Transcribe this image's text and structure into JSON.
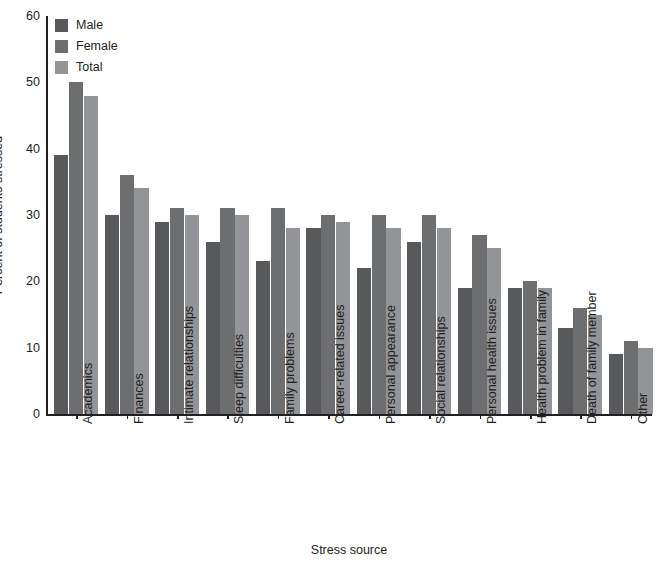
{
  "chart_data": {
    "type": "bar",
    "title": "",
    "xlabel": "Stress source",
    "ylabel": "Percent of students stressed",
    "ylim": [
      0,
      60
    ],
    "yticks": [
      0,
      10,
      20,
      30,
      40,
      50,
      60
    ],
    "grid": false,
    "legend_position": "top-left",
    "categories": [
      "Academics",
      "Finances",
      "Intimate relationships",
      "Sleep difficulties",
      "Family problems",
      "Career-related issues",
      "Personal appearance",
      "Social relationships",
      "Personal health issues",
      "Health problem in family",
      "Death of family member",
      "Other"
    ],
    "series": [
      {
        "name": "Male",
        "color": "#58595b",
        "values": [
          39,
          30,
          29,
          26,
          23,
          28,
          22,
          26,
          19,
          19,
          13,
          9
        ]
      },
      {
        "name": "Female",
        "color": "#6d6e70",
        "values": [
          50,
          36,
          31,
          31,
          31,
          30,
          30,
          30,
          27,
          20,
          16,
          11
        ]
      },
      {
        "name": "Total",
        "color": "#929497",
        "values": [
          48,
          34,
          30,
          30,
          28,
          29,
          28,
          28,
          25,
          19,
          15,
          10
        ]
      }
    ]
  },
  "legend": {
    "items": [
      {
        "label": "Male"
      },
      {
        "label": "Female"
      },
      {
        "label": "Total"
      }
    ]
  }
}
